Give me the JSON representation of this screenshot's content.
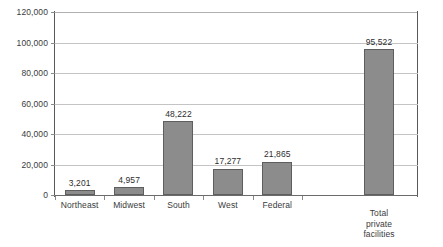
{
  "chart_data": {
    "type": "bar",
    "title": "",
    "subtitle": "",
    "xlabel": "",
    "ylabel": "",
    "ylim": [
      0,
      120000
    ],
    "grid": true,
    "legend": false,
    "orientation": "vertical",
    "categories": [
      "Northeast",
      "Midwest",
      "South",
      "West",
      "Federal",
      "Total\nprivate\nfacilities"
    ],
    "values": [
      3201,
      4957,
      48222,
      17277,
      21865,
      95522
    ],
    "data_labels": [
      "3,201",
      "4,957",
      "48,222",
      "17,277",
      "21,865",
      "95,522"
    ],
    "y_ticks": [
      0,
      20000,
      40000,
      60000,
      80000,
      100000,
      120000
    ],
    "y_tick_labels": [
      "0",
      "20,000",
      "40,000",
      "60,000",
      "80,000",
      "100,000",
      "120,000"
    ],
    "colors": {
      "bar_fill": "#8c8c8c",
      "bar_outline": "#5e5e5e",
      "gridline": "#c4c4c4",
      "axis": "#595959",
      "text": "#3a3a3a",
      "background": "#ffffff"
    }
  }
}
